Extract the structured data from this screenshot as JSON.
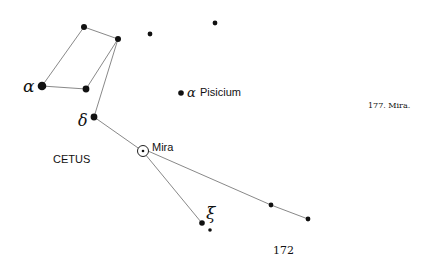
{
  "diagram": {
    "constellation_label": "CETUS",
    "caption": "177. Mira.",
    "page_number": "172",
    "stars": {
      "alpha": {
        "symbol": "α"
      },
      "delta": {
        "symbol": "δ"
      },
      "xi": {
        "symbol": "ξ"
      },
      "mira": {
        "label": "Mira"
      },
      "alpha_pisicium": {
        "symbol": "α",
        "label": "Pisicium"
      }
    }
  }
}
